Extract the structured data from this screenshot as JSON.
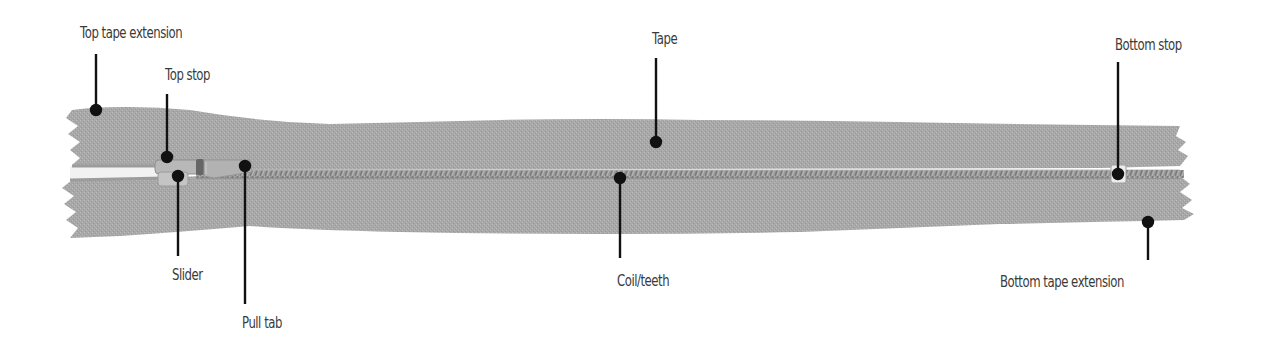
{
  "diagram": {
    "colors": {
      "tape": "#a9a9a9",
      "tape_dark": "#9a9a9a",
      "coil": "#8c8c8c",
      "slider": "#b5b5b5",
      "bottom_stop": "#e6e6e6",
      "leader_line": "#111111",
      "label_text": "#3a3a3a",
      "background": "#ffffff"
    },
    "labels": [
      {
        "id": "top-tape-extension",
        "text": "Top tape extension",
        "x": 80,
        "y": 24,
        "line": {
          "x": 96,
          "y1": 54,
          "y2": 110
        }
      },
      {
        "id": "top-stop",
        "text": "Top stop",
        "x": 165,
        "y": 66,
        "line": {
          "x": 167,
          "y1": 94,
          "y2": 156
        }
      },
      {
        "id": "slider",
        "text": "Slider",
        "x": 173,
        "y": 266,
        "line": {
          "x": 178,
          "y1": 176,
          "y2": 256
        }
      },
      {
        "id": "pull-tab",
        "text": "Pull tab",
        "x": 243,
        "y": 314,
        "line": {
          "x": 245,
          "y1": 166,
          "y2": 304
        }
      },
      {
        "id": "tape",
        "text": "Tape",
        "x": 653,
        "y": 30,
        "line": {
          "x": 656,
          "y1": 58,
          "y2": 142
        }
      },
      {
        "id": "coil-teeth",
        "text": "Coil/teeth",
        "x": 618,
        "y": 272,
        "line": {
          "x": 620,
          "y1": 178,
          "y2": 258
        }
      },
      {
        "id": "bottom-stop",
        "text": "Bottom stop",
        "x": 1115,
        "y": 36,
        "line": {
          "x": 1118,
          "y1": 62,
          "y2": 174
        }
      },
      {
        "id": "bottom-tape-extension",
        "text": "Bottom tape extension",
        "x": 1000,
        "y": 273,
        "line": {
          "x": 1148,
          "y1": 222,
          "y2": 260
        }
      }
    ]
  }
}
